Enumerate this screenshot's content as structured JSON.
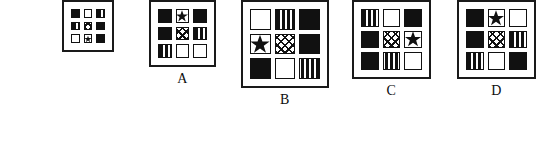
{
  "puzzle": {
    "type": "matrix-reasoning-multiple-choice",
    "cell_patterns": [
      "black",
      "white",
      "stripes",
      "cross",
      "star"
    ],
    "colors": {
      "ink": "#111111",
      "panel_border": "#1a1a1a",
      "background": "#ffffff"
    },
    "stem": {
      "label": "",
      "has_label": false,
      "grid": [
        [
          "black",
          "white",
          "stripes"
        ],
        [
          "stripes",
          "cross",
          "black"
        ],
        [
          "white",
          "star",
          "black"
        ]
      ]
    },
    "options": [
      {
        "label": "A",
        "grid": [
          [
            "black",
            "star",
            "black"
          ],
          [
            "black",
            "cross",
            "stripes"
          ],
          [
            "stripes",
            "white",
            "white"
          ]
        ]
      },
      {
        "label": "B",
        "grid": [
          [
            "white",
            "stripes",
            "black"
          ],
          [
            "star",
            "cross",
            "black"
          ],
          [
            "black",
            "white",
            "stripes"
          ]
        ]
      },
      {
        "label": "C",
        "grid": [
          [
            "stripes",
            "white",
            "black"
          ],
          [
            "black",
            "cross",
            "star"
          ],
          [
            "black",
            "stripes",
            "white"
          ]
        ]
      },
      {
        "label": "D",
        "grid": [
          [
            "black",
            "star",
            "white"
          ],
          [
            "black",
            "cross",
            "stripes"
          ],
          [
            "stripes",
            "white",
            "black"
          ]
        ]
      }
    ]
  },
  "layout": {
    "panels": [
      {
        "left": 62,
        "width": 52,
        "cell": 10
      },
      {
        "left": 149,
        "width": 74,
        "cell": 15
      },
      {
        "left": 241,
        "width": 102,
        "cell": 22
      },
      {
        "left": 352,
        "width": 88,
        "cell": 19
      },
      {
        "left": 457,
        "width": 88,
        "cell": 19
      }
    ]
  }
}
